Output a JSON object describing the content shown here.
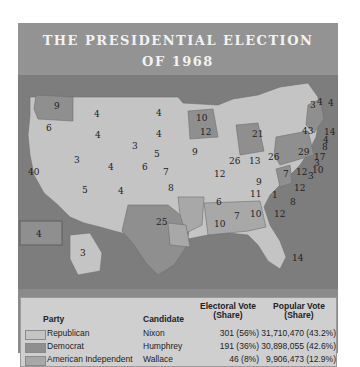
{
  "title": {
    "line1": "THE PRESIDENTIAL ELECTION",
    "line2": "OF 1968"
  },
  "colors": {
    "republican": "#c4c4c4",
    "democrat": "#8f8f8f",
    "american_independent": "#a8a8a8",
    "water": "#7f7f7f",
    "header": "#939393"
  },
  "map": {
    "states": [
      {
        "label": "9",
        "party": "democrat"
      },
      {
        "label": "6",
        "party": "republican"
      },
      {
        "label": "4",
        "party": "republican"
      },
      {
        "label": "4",
        "party": "republican"
      },
      {
        "label": "4",
        "party": "republican"
      },
      {
        "label": "4",
        "party": "republican"
      },
      {
        "label": "3",
        "party": "republican"
      },
      {
        "label": "3",
        "party": "republican"
      },
      {
        "label": "40",
        "party": "republican"
      },
      {
        "label": "4",
        "party": "republican"
      },
      {
        "label": "6",
        "party": "republican"
      },
      {
        "label": "5",
        "party": "republican"
      },
      {
        "label": "5",
        "party": "republican"
      },
      {
        "label": "4",
        "party": "republican"
      },
      {
        "label": "7",
        "party": "republican"
      },
      {
        "label": "8",
        "party": "republican"
      },
      {
        "label": "25",
        "party": "democrat"
      },
      {
        "label": "10",
        "party": "democrat"
      },
      {
        "label": "9",
        "party": "republican"
      },
      {
        "label": "12",
        "party": "republican"
      },
      {
        "label": "12",
        "party": "republican"
      },
      {
        "label": "6",
        "party": "american_independent"
      },
      {
        "label": "10",
        "party": "american_independent"
      },
      {
        "label": "26",
        "party": "republican"
      },
      {
        "label": "13",
        "party": "republican"
      },
      {
        "label": "21",
        "party": "democrat"
      },
      {
        "label": "26",
        "party": "republican"
      },
      {
        "label": "9",
        "party": "republican"
      },
      {
        "label": "11",
        "party": "republican"
      },
      {
        "label": "7",
        "party": "american_independent"
      },
      {
        "label": "10",
        "party": "american_independent"
      },
      {
        "label": "12",
        "party": "american_independent"
      },
      {
        "label": "14",
        "party": "republican"
      },
      {
        "label": "1",
        "party": "american_independent"
      },
      {
        "label": "12",
        "party": "republican"
      },
      {
        "label": "8",
        "party": "republican"
      },
      {
        "label": "12",
        "party": "republican"
      },
      {
        "label": "7",
        "party": "democrat"
      },
      {
        "label": "29",
        "party": "democrat"
      },
      {
        "label": "43",
        "party": "democrat"
      },
      {
        "label": "3",
        "party": "republican"
      },
      {
        "label": "4",
        "party": "republican"
      },
      {
        "label": "4",
        "party": "democrat"
      },
      {
        "label": "14",
        "party": "democrat"
      },
      {
        "label": "4",
        "party": "democrat"
      },
      {
        "label": "8",
        "party": "democrat"
      },
      {
        "label": "17",
        "party": "republican"
      },
      {
        "label": "3",
        "party": "republican"
      },
      {
        "label": "10",
        "party": "democrat"
      },
      {
        "label": "3",
        "party": "democrat"
      },
      {
        "label": "4",
        "party": "democrat"
      },
      {
        "label": "3",
        "party": "republican"
      }
    ]
  },
  "legend": {
    "headers": {
      "party": "Party",
      "candidate": "Candidate",
      "electoral_l1": "Electoral Vote",
      "electoral_l2": "(Share)",
      "popular_l1": "Popular Vote",
      "popular_l2": "(Share)"
    },
    "rows": [
      {
        "party": "Republican",
        "candidate": "Nixon",
        "electoral": "301 (56%)",
        "popular": "31,710,470 (43.2%)",
        "color": "#c4c4c4"
      },
      {
        "party": "Democrat",
        "candidate": "Humphrey",
        "electoral": "191 (36%)",
        "popular": "30,898,055 (42.6%)",
        "color": "#8f8f8f"
      },
      {
        "party": "American Independent",
        "candidate": "Wallace",
        "electoral": "46 (8%)",
        "popular": "9,906,473 (12.9%)",
        "color": "#a8a8a8"
      }
    ]
  }
}
